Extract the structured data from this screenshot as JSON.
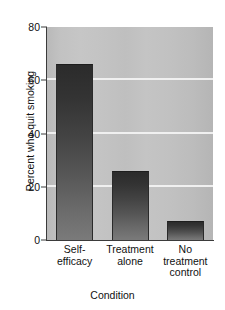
{
  "chart_data": {
    "type": "bar",
    "title": "",
    "subtitle": "",
    "xlabel": "Condition",
    "ylabel": "Percent who quit smoking",
    "categories": [
      "Self-efficacy",
      "Treatment alone",
      "No treatment control"
    ],
    "category_lines": [
      [
        "Self-",
        "efficacy"
      ],
      [
        "Treatment",
        "alone"
      ],
      [
        "No",
        "treatment",
        "control"
      ]
    ],
    "values": [
      66,
      26,
      7
    ],
    "ylim": [
      0,
      80
    ],
    "yticks": [
      0,
      20,
      40,
      60,
      80
    ],
    "ytick_labels": [
      "0",
      "20",
      "40",
      "60",
      "80"
    ],
    "grid": true,
    "grid_color": "#f2f2f2",
    "legend": null,
    "bar_color_top": "#2b2b2b",
    "bar_color_bottom": "#7a7a7a",
    "plot_background": "#c2c2c2",
    "axis_color": "#3b3b3b",
    "figure_background": "#ffffff"
  }
}
